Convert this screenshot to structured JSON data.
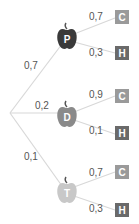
{
  "diagram": {
    "type": "probability-tree",
    "root": "",
    "branches": [
      {
        "node": "P",
        "probability": "0,7",
        "color": "#3a3a3a",
        "outcomes": [
          {
            "label": "C",
            "probability": "0,7",
            "color": "#9a9a9a"
          },
          {
            "label": "H",
            "probability": "0,3",
            "color": "#6a6a6a"
          }
        ]
      },
      {
        "node": "D",
        "probability": "0,2",
        "color": "#8a8a8a",
        "outcomes": [
          {
            "label": "C",
            "probability": "0,9",
            "color": "#9a9a9a"
          },
          {
            "label": "H",
            "probability": "0,1",
            "color": "#6a6a6a"
          }
        ]
      },
      {
        "node": "T",
        "probability": "0,1",
        "color": "#c8c8c8",
        "outcomes": [
          {
            "label": "C",
            "probability": "0,7",
            "color": "#9a9a9a"
          },
          {
            "label": "H",
            "probability": "0,3",
            "color": "#6a6a6a"
          }
        ]
      }
    ]
  }
}
